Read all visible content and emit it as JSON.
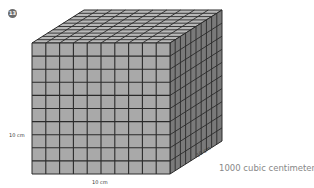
{
  "figure": {
    "number": "13",
    "grid_divisions": 10,
    "labels": {
      "height": "10 cm",
      "width": "10 cm",
      "depth": "10 cm"
    },
    "caption": "1000 cubic centimeters",
    "colors": {
      "front_face": "#a9a9a9",
      "top_face": "#b8b8b8",
      "right_face": "#7a7a7a",
      "grid_line": "#2a2a2a",
      "badge": "#6b6b6b",
      "caption": "#888888"
    }
  }
}
